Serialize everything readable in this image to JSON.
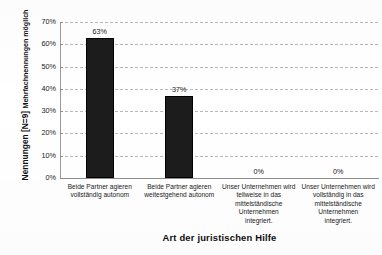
{
  "chart_data": {
    "type": "bar",
    "title": "",
    "xlabel": "Art der juristischen Hilfe",
    "ylabel": "Nennungen [N=9]",
    "ylabel_secondary": "Mehrfachnennungen möglich",
    "categories": [
      "Beide Partner agieren vollständig autonom",
      "Beide Partner agieren weitestgehend autonom",
      "Unser Unternehmen wird teilweise in das mittelständische Unternehmen integriert.",
      "Unser Unternehmen wird vollständig in das mittelständische Unternehmen integriert."
    ],
    "category_lines": [
      [
        "Beide Partner agieren",
        "vollständig autonom"
      ],
      [
        "Beide Partner agieren",
        "weitestgehend autonom"
      ],
      [
        "Unser Unternehmen wird",
        "teilweise in das",
        "mittelständische",
        "Unternehmen",
        "integriert."
      ],
      [
        "Unser Unternehmen wird",
        "vollständig in das",
        "mittelständische",
        "Unternehmen",
        "integriert."
      ]
    ],
    "values": [
      63,
      37,
      0,
      0
    ],
    "value_labels": [
      "63%",
      "37%",
      "0%",
      "0%"
    ],
    "ylim": [
      0,
      70
    ],
    "ytick_values": [
      0,
      10,
      20,
      30,
      40,
      50,
      60,
      70
    ],
    "ytick_labels": [
      "0%",
      "10%",
      "20%",
      "30%",
      "40%",
      "50%",
      "60%",
      "70%"
    ],
    "grid": true,
    "legend": "none",
    "bar_color": "#1c1c1c",
    "grid_color": "#b9b9b9",
    "axis_color": "#8d8d8d",
    "background_color": "#ffffff",
    "text_color": "#1a1a1a"
  },
  "axis": {
    "y_title_main": "Nennungen [N=9]",
    "y_title_sub": "Mehrfachnennungen möglich",
    "x_title": "Art der juristischen Hilfe"
  }
}
